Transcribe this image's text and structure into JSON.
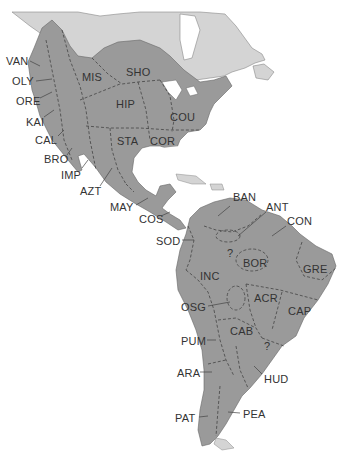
{
  "map": {
    "title": "Native cultural areas of the Americas",
    "colors": {
      "background": "#ffffff",
      "region_fill": "#9a9a9a",
      "unshaded_land": "#d4d4d4",
      "boundary": "#444444",
      "label_text": "#333333"
    },
    "regions": [
      {
        "code": "VAN",
        "x": 6,
        "y": 56
      },
      {
        "code": "OLY",
        "x": 12,
        "y": 76
      },
      {
        "code": "ORE",
        "x": 16,
        "y": 96
      },
      {
        "code": "KAI",
        "x": 26,
        "y": 117
      },
      {
        "code": "CAL",
        "x": 35,
        "y": 135
      },
      {
        "code": "BRO",
        "x": 44,
        "y": 154
      },
      {
        "code": "IMP",
        "x": 61,
        "y": 170
      },
      {
        "code": "AZT",
        "x": 80,
        "y": 186
      },
      {
        "code": "MAY",
        "x": 110,
        "y": 202
      },
      {
        "code": "COS",
        "x": 139,
        "y": 214
      },
      {
        "code": "SOD",
        "x": 156,
        "y": 236
      },
      {
        "code": "MIS",
        "x": 82,
        "y": 72
      },
      {
        "code": "SHO",
        "x": 126,
        "y": 67
      },
      {
        "code": "HIP",
        "x": 116,
        "y": 99
      },
      {
        "code": "COU",
        "x": 170,
        "y": 112
      },
      {
        "code": "STA",
        "x": 117,
        "y": 136
      },
      {
        "code": "COR",
        "x": 150,
        "y": 136
      },
      {
        "code": "BAN",
        "x": 233,
        "y": 192
      },
      {
        "code": "ANT",
        "x": 266,
        "y": 202
      },
      {
        "code": "CON",
        "x": 287,
        "y": 216
      },
      {
        "code": "BOR",
        "x": 243,
        "y": 258
      },
      {
        "code": "GRE",
        "x": 303,
        "y": 264
      },
      {
        "code": "INC",
        "x": 200,
        "y": 271
      },
      {
        "code": "OSG",
        "x": 181,
        "y": 302
      },
      {
        "code": "ACR",
        "x": 254,
        "y": 293
      },
      {
        "code": "CAP",
        "x": 288,
        "y": 306
      },
      {
        "code": "CAB",
        "x": 230,
        "y": 326
      },
      {
        "code": "PUM",
        "x": 181,
        "y": 336
      },
      {
        "code": "HUD",
        "x": 264,
        "y": 374
      },
      {
        "code": "ARA",
        "x": 177,
        "y": 368
      },
      {
        "code": "PAT",
        "x": 175,
        "y": 413
      },
      {
        "code": "PEA",
        "x": 243,
        "y": 409
      }
    ],
    "unknown_markers": [
      {
        "text": "?",
        "x": 227,
        "y": 248
      },
      {
        "text": "?",
        "x": 264,
        "y": 341
      }
    ]
  }
}
